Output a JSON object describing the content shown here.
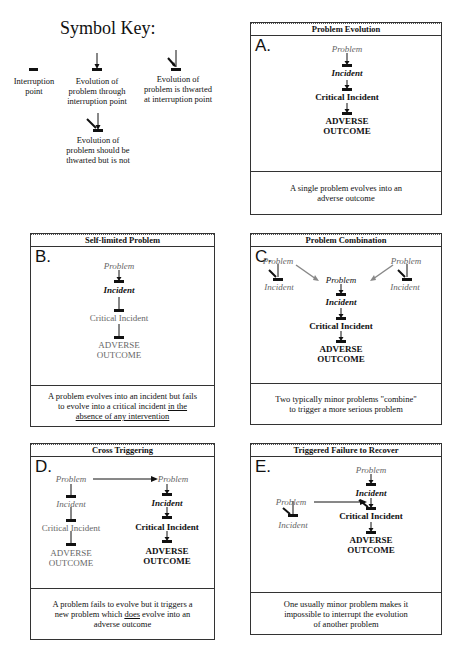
{
  "key": {
    "title": "Symbol Key:",
    "items": [
      {
        "icon": "interruption-point-icon",
        "label_lines": [
          "Interruption",
          "point"
        ]
      },
      {
        "icon": "evolution-through-icon",
        "label_lines": [
          "Evolution of",
          "problem  through",
          "interruption point"
        ]
      },
      {
        "icon": "evolution-thwarted-icon",
        "label_lines": [
          "Evolution of",
          "problem is thwarted",
          "at interruption point"
        ]
      },
      {
        "icon": "evolution-should-be-thwarted-icon",
        "label_lines": [
          "Evolution of",
          "problem should be",
          "thwarted but is not"
        ]
      }
    ]
  },
  "panels": {
    "A": {
      "title": "Problem  Evolution",
      "letter": "A.",
      "nodes": {
        "problem": "Problem",
        "incident": "Incident",
        "critical": "Critical  Incident",
        "adverse1": "ADVERSE",
        "adverse2": "OUTCOME"
      },
      "caption_lines": [
        "A single problem evolves into an",
        "adverse outcome"
      ]
    },
    "B": {
      "title": "Self-limited  Problem",
      "letter": "B.",
      "nodes": {
        "problem": "Problem",
        "incident": "Incident",
        "critical": "Critical  Incident",
        "adverse1": "ADVERSE",
        "adverse2": "OUTCOME"
      },
      "caption_lines": [
        "A problem evolves into an incident but fails",
        "to evolve into a critical incident "
      ],
      "caption_underlined": [
        "in the",
        "absence of any intervention"
      ]
    },
    "C": {
      "title": "Problem  Combination",
      "letter": "C.",
      "nodes": {
        "left_problem": "Problem",
        "left_incident": "Incident",
        "right_problem": "Problem",
        "right_incident": "Incident",
        "problem": "Problem",
        "incident": "Incident",
        "critical": "Critical  Incident",
        "adverse1": "ADVERSE",
        "adverse2": "OUTCOME"
      },
      "caption_lines": [
        "Two typically minor problems \"combine\"",
        "to trigger a more serious problem"
      ]
    },
    "D": {
      "title": "Cross  Triggering",
      "letter": "D.",
      "left": {
        "problem": "Problem",
        "incident": "Incident",
        "critical": "Critical  Incident",
        "adverse1": "ADVERSE",
        "adverse2": "OUTCOME"
      },
      "right": {
        "problem": "Problem",
        "incident": "Incident",
        "critical": "Critical  Incident",
        "adverse1": "ADVERSE",
        "adverse2": "OUTCOME"
      },
      "caption_line1": "A problem fails to evolve but it triggers a",
      "caption_line2_pre": "new problem which ",
      "caption_line2_u": "does",
      "caption_line2_post": " evolve into an",
      "caption_line3": "adverse outcome"
    },
    "E": {
      "title": "Triggered  Failure  to  Recover",
      "letter": "E.",
      "left": {
        "problem": "Problem",
        "incident": "Incident"
      },
      "main": {
        "problem": "Problem",
        "incident": "Incident",
        "critical": "Critical  Incident",
        "adverse1": "ADVERSE",
        "adverse2": "OUTCOME"
      },
      "caption_lines": [
        "One usually minor problem makes it",
        "impossible to interrupt the evolution",
        "of another problem"
      ]
    }
  },
  "colors": {
    "line": "#111111",
    "grey": "#777777",
    "border": "#333333"
  }
}
